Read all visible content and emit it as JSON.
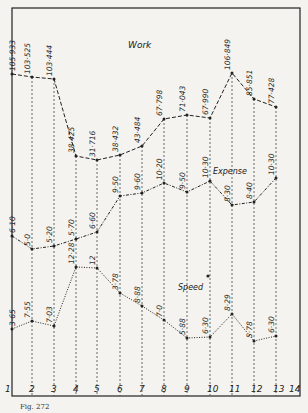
{
  "chart_data": {
    "type": "line",
    "title": "",
    "caption": "Fig. 272",
    "xlabel": "",
    "ylabel": "",
    "x": [
      1,
      2,
      3,
      4,
      5,
      6,
      7,
      8,
      9,
      10,
      11,
      12,
      13
    ],
    "x_tick_labels": [
      "1",
      "2",
      "3",
      "4",
      "5",
      "6",
      "7",
      "8",
      "9",
      "10",
      "11",
      "12",
      "13",
      "14"
    ],
    "grid": "vertical dashed lines at each x",
    "legend": "inline curve labels",
    "series": [
      {
        "name": "Work",
        "label": "Work",
        "style": "dashed",
        "value_labels": [
          "105·933",
          "103·525",
          "103·444",
          "38·425",
          "31·716",
          "38·432",
          "43·484",
          "67·798",
          "71·043",
          "67·990",
          "106·849",
          "85·851",
          "77·428"
        ],
        "values": [
          105.933,
          103.525,
          103.444,
          38.425,
          31.716,
          38.432,
          43.484,
          67.798,
          71.043,
          67.99,
          106.849,
          85.851,
          77.428
        ],
        "pixel_y": [
          74,
          77,
          79,
          156,
          160,
          155,
          146,
          119,
          115,
          118,
          73,
          99,
          107
        ]
      },
      {
        "name": "Expense",
        "label": "Expense",
        "style": "dash-dot",
        "value_labels": [
          "6·10",
          "5·0",
          "5·20",
          "5·70",
          "6·60",
          "9·50",
          "9·60",
          "10·20",
          "9·50",
          "10·30",
          "8·30",
          "8·40",
          "10·30"
        ],
        "values": [
          6.1,
          5.0,
          5.2,
          5.7,
          6.6,
          9.5,
          9.6,
          10.2,
          9.5,
          10.3,
          8.3,
          8.4,
          10.3
        ],
        "pixel_y": [
          236,
          249,
          246,
          239,
          232,
          196,
          193,
          183,
          192,
          181,
          205,
          202,
          178
        ]
      },
      {
        "name": "Speed",
        "label": "Speed",
        "style": "dotted",
        "value_labels": [
          "3·65",
          "7·55",
          "7·03",
          "12·28",
          "12",
          "3·78",
          "8·88",
          "7·0",
          "5·88",
          "6·30",
          "8·29",
          "5·78",
          "6·30"
        ],
        "values": [
          3.65,
          7.55,
          7.03,
          12.28,
          12.0,
          3.78,
          8.88,
          7.0,
          5.88,
          6.3,
          8.29,
          5.78,
          6.3
        ],
        "pixel_y": [
          329,
          321,
          326,
          267,
          268,
          293,
          306,
          320,
          338,
          337,
          314,
          341,
          336
        ]
      }
    ],
    "annotations": [
      "Work",
      "Expense",
      "Speed"
    ]
  },
  "labels": {
    "work": "Work",
    "expense": "Expense",
    "speed": "Speed",
    "caption": "Fig. 272"
  }
}
